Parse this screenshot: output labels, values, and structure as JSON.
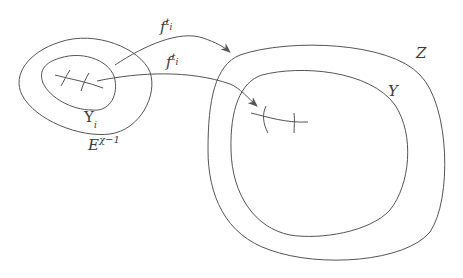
{
  "diagram": {
    "stroke_color": "#555555",
    "background": "#ffffff",
    "regions": [
      {
        "id": "E",
        "label_base": "E",
        "label_sup": "χ−1",
        "description": "outer left region"
      },
      {
        "id": "Upsilon",
        "label_base": "Υ",
        "label_sub": "i",
        "description": "inner left region"
      },
      {
        "id": "Z",
        "label_base": "Z",
        "description": "outer right region"
      },
      {
        "id": "Y",
        "label_base": "Y",
        "description": "inner right region"
      }
    ],
    "arrows": [
      {
        "id": "map-top",
        "label_base": "f",
        "label_sup": "t",
        "label_sup_sub": "i",
        "from": "Upsilon",
        "to": "Z"
      },
      {
        "id": "map-bottom",
        "label_base": "f",
        "label_sup": "t",
        "label_sup_sub": "i",
        "from": "curve-in-Upsilon",
        "to": "curve-in-Y"
      }
    ],
    "labels": {
      "f_top": {
        "base": "f",
        "sup": "t",
        "supsub": "i"
      },
      "f_bottom": {
        "base": "f",
        "sup": "t",
        "supsub": "i"
      },
      "upsilon": {
        "base": "Υ",
        "sub": "i"
      },
      "E": {
        "base": "E",
        "sup": "χ−1"
      },
      "Z": {
        "base": "Z"
      },
      "Y": {
        "base": "Y"
      }
    }
  }
}
